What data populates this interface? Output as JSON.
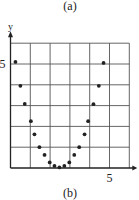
{
  "captions": {
    "top": "(a)",
    "bottom": "(b)"
  },
  "chart_data": {
    "type": "scatter",
    "title": "",
    "xlabel": "",
    "ylabel": "y",
    "xlim": [
      0,
      6
    ],
    "ylim": [
      0,
      6
    ],
    "grid": true,
    "x_ticks_labeled": [
      {
        "value": 5,
        "label": "5"
      }
    ],
    "y_ticks_labeled": [
      {
        "value": 5,
        "label": "5"
      }
    ],
    "legend": null,
    "series": [
      {
        "name": "points",
        "color": "#222222",
        "points": [
          [
            0.25,
            5.1
          ],
          [
            0.5,
            3.95
          ],
          [
            0.72,
            3.08
          ],
          [
            1.03,
            2.25
          ],
          [
            1.21,
            1.62
          ],
          [
            1.46,
            1.0
          ],
          [
            1.72,
            0.63
          ],
          [
            1.98,
            0.27
          ],
          [
            2.22,
            0.1
          ],
          [
            2.47,
            0.03
          ],
          [
            2.72,
            0.1
          ],
          [
            2.97,
            0.27
          ],
          [
            3.22,
            0.63
          ],
          [
            3.47,
            1.0
          ],
          [
            3.74,
            1.62
          ],
          [
            3.92,
            2.25
          ],
          [
            4.19,
            3.07
          ],
          [
            4.46,
            3.95
          ],
          [
            4.7,
            5.05
          ]
        ]
      }
    ]
  },
  "layout": {
    "origin_px": [
      10.5,
      168
    ],
    "unit_px": [
      19.8,
      20.8
    ],
    "grid_color": "#555555",
    "axis_color": "#222222"
  }
}
